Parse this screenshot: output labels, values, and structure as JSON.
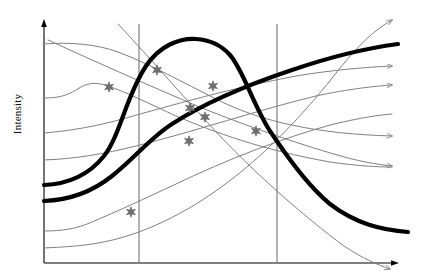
{
  "figure": {
    "axes": {
      "y_axis_label": "Intensity",
      "x_axis_label": "",
      "y_axis_arrow": "arrow-up-icon",
      "x_axis_arrow": "arrow-right-icon",
      "axis_color": "#000000",
      "origin": {
        "x": 44,
        "y": 263
      },
      "y_top": {
        "x": 44,
        "y": 22
      },
      "x_right": {
        "x": 396,
        "y": 263
      }
    },
    "colors": {
      "primary_curve": "#000000",
      "secondary_curve": "#808080",
      "marker": "#6e6e6e",
      "divider": "#555555",
      "background": "#ffffff"
    },
    "dividers": [
      {
        "name": "divider-left",
        "x": 139,
        "y_top": 24,
        "y_bottom": 262
      },
      {
        "name": "divider-right",
        "x": 277,
        "y_top": 24,
        "y_bottom": 262
      }
    ]
  },
  "chart_data": {
    "type": "line",
    "title": "",
    "xlabel": "",
    "ylabel": "Intensity",
    "grid": false,
    "legend": null,
    "xlim": [
      44,
      410
    ],
    "ylim": [
      263,
      22
    ],
    "note": "Schematic plot: two bold black curves (one sigmoid-rising, one peaked) over eight thin gray arrow-terminated trend curves, with gray star markers along several gray curves.",
    "vertical_dividers_x": [
      139,
      277
    ],
    "series": [
      {
        "name": "bold-rising-curve",
        "style": "bold-black",
        "width": 4.2,
        "arrow": false,
        "path": "M 44,201 C 70,200 92,192 112,176 C 136,157 150,138 172,124 C 206,102 250,84 292,70 C 330,57 368,48 398,44",
        "points": [
          [
            44,
            201
          ],
          [
            80,
            197
          ],
          [
            112,
            176
          ],
          [
            140,
            152
          ],
          [
            172,
            124
          ],
          [
            213,
            104
          ],
          [
            250,
            89
          ],
          [
            292,
            70
          ],
          [
            340,
            55
          ],
          [
            398,
            44
          ]
        ]
      },
      {
        "name": "bold-peak-curve",
        "style": "bold-black",
        "width": 4.2,
        "arrow": false,
        "path": "M 44,185 C 68,184 88,176 104,156 C 120,136 126,96 146,66 C 160,45 180,38 196,39 C 212,40 222,46 230,55 C 244,71 254,108 272,134 C 288,158 308,186 330,204 C 356,224 382,230 408,232",
        "points": [
          [
            44,
            185
          ],
          [
            80,
            171
          ],
          [
            104,
            156
          ],
          [
            128,
            102
          ],
          [
            150,
            60
          ],
          [
            180,
            38
          ],
          [
            210,
            41
          ],
          [
            232,
            58
          ],
          [
            256,
            106
          ],
          [
            290,
            162
          ],
          [
            330,
            204
          ],
          [
            370,
            224
          ],
          [
            408,
            232
          ]
        ]
      },
      {
        "name": "gray-curve-top-rising",
        "style": "thin-gray",
        "width": 1,
        "arrow": true,
        "path": "M 44,44 C 70,42 96,44 118,52 C 150,64 182,82 218,100 C 262,122 318,134 392,136",
        "points": [
          [
            44,
            44
          ],
          [
            90,
            43
          ],
          [
            130,
            58
          ],
          [
            180,
            82
          ],
          [
            240,
            112
          ],
          [
            310,
            131
          ],
          [
            392,
            136
          ]
        ]
      },
      {
        "name": "gray-curve-bump",
        "style": "thin-gray",
        "width": 1,
        "arrow": false,
        "path": "M 44,98 C 58,98 66,96 76,90 C 88,82 96,82 108,86 C 126,92 150,104 176,116 C 214,132 262,150 330,162 C 358,166 378,167 392,167",
        "points": [
          [
            44,
            98
          ],
          [
            76,
            90
          ],
          [
            104,
            86
          ],
          [
            140,
            101
          ],
          [
            190,
            122
          ],
          [
            250,
            143
          ],
          [
            320,
            161
          ],
          [
            392,
            167
          ]
        ]
      },
      {
        "name": "gray-curve-mid-rising",
        "style": "thin-gray",
        "width": 1,
        "arrow": true,
        "path": "M 44,133 C 70,131 98,126 126,118 C 176,104 232,88 296,76 C 332,70 368,67 392,66",
        "points": [
          [
            44,
            133
          ],
          [
            90,
            128
          ],
          [
            126,
            118
          ],
          [
            190,
            98
          ],
          [
            250,
            85
          ],
          [
            320,
            72
          ],
          [
            392,
            66
          ]
        ]
      },
      {
        "name": "gray-curve-low-rising",
        "style": "thin-gray",
        "width": 1,
        "arrow": true,
        "path": "M 44,160 C 74,159 104,154 136,146 C 196,131 258,110 316,96 C 348,89 376,86 392,85",
        "points": [
          [
            44,
            160
          ],
          [
            90,
            156
          ],
          [
            136,
            146
          ],
          [
            200,
            128
          ],
          [
            260,
            109
          ],
          [
            330,
            92
          ],
          [
            392,
            85
          ]
        ]
      },
      {
        "name": "gray-curve-bottom-rise-left",
        "style": "thin-gray",
        "width": 1,
        "arrow": false,
        "path": "M 44,231 C 62,231 76,229 92,222 C 118,211 146,198 176,184 C 226,160 282,138 334,124 C 360,118 378,115 392,114",
        "points": [
          [
            44,
            231
          ],
          [
            92,
            222
          ],
          [
            140,
            201
          ],
          [
            190,
            178
          ],
          [
            250,
            154
          ],
          [
            320,
            128
          ],
          [
            392,
            114
          ]
        ]
      },
      {
        "name": "gray-curve-steep-rise",
        "style": "thin-gray",
        "width": 1,
        "arrow": true,
        "path": "M 44,248 C 64,247 82,246 98,243 C 140,236 186,214 228,182 C 268,152 306,112 340,68 C 358,46 374,30 392,20",
        "points": [
          [
            44,
            248
          ],
          [
            98,
            243
          ],
          [
            150,
            220
          ],
          [
            210,
            192
          ],
          [
            270,
            140
          ],
          [
            320,
            86
          ],
          [
            392,
            20
          ]
        ]
      },
      {
        "name": "gray-curve-falling-shallow",
        "style": "thin-gray",
        "width": 1,
        "arrow": true,
        "path": "M 48,40 C 96,62 150,86 202,108 C 252,128 304,146 348,158 C 368,163 382,165 392,166",
        "points": [
          [
            48,
            40
          ],
          [
            110,
            68
          ],
          [
            160,
            90
          ],
          [
            213,
            112
          ],
          [
            270,
            135
          ],
          [
            330,
            153
          ],
          [
            392,
            166
          ]
        ]
      },
      {
        "name": "gray-curve-falling-steep",
        "style": "thin-gray",
        "width": 1,
        "arrow": true,
        "path": "M 118,24 C 150,58 186,100 220,136 C 258,176 306,218 344,246 C 362,258 378,265 390,269",
        "points": [
          [
            118,
            24
          ],
          [
            160,
            70
          ],
          [
            200,
            114
          ],
          [
            250,
            166
          ],
          [
            300,
            210
          ],
          [
            344,
            246
          ],
          [
            390,
            269
          ]
        ]
      }
    ],
    "markers": {
      "symbol": "six-point-star",
      "color": "#6e6e6e",
      "size": 8,
      "points": [
        {
          "name": "marker-1",
          "x": 109,
          "y": 87
        },
        {
          "name": "marker-2",
          "x": 157,
          "y": 70
        },
        {
          "name": "marker-3",
          "x": 213,
          "y": 86
        },
        {
          "name": "marker-4",
          "x": 190,
          "y": 108
        },
        {
          "name": "marker-5",
          "x": 205,
          "y": 117
        },
        {
          "name": "marker-6",
          "x": 189,
          "y": 141
        },
        {
          "name": "marker-7",
          "x": 256,
          "y": 131
        },
        {
          "name": "marker-8",
          "x": 131,
          "y": 212
        }
      ]
    }
  }
}
